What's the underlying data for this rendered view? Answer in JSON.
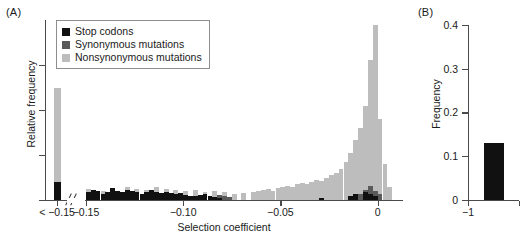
{
  "panels": {
    "a": {
      "label": "(A)"
    },
    "b": {
      "label": "(B)"
    }
  },
  "legend": {
    "items": [
      {
        "label": "Stop codons",
        "color": "#111111"
      },
      {
        "label": "Synonymous mutations",
        "color": "#5a5a5a"
      },
      {
        "label": "Nonsynonymous mutations",
        "color": "#bdbdbd"
      }
    ]
  },
  "chart_data": [
    {
      "type": "bar",
      "panel": "(A)",
      "title": "",
      "xlabel": "Selection coefficient",
      "ylabel": "Relative frequency",
      "xlim": [
        -0.163,
        0.012
      ],
      "ylim": [
        0,
        1.0
      ],
      "grid": false,
      "legend_position": "top-left",
      "axis_break": true,
      "axis_break_note": "break between the '< -0.15' overflow bin and the continuous axis starting at -0.15",
      "xticks": [
        {
          "value": -0.1595,
          "label": "< −0.15"
        },
        {
          "value": -0.15,
          "label": "−0.15"
        },
        {
          "value": -0.1,
          "label": "−0.10"
        },
        {
          "value": -0.05,
          "label": "−0.05"
        },
        {
          "value": 0.0,
          "label": "0"
        }
      ],
      "yticks": [
        0,
        0.25,
        0.5,
        0.75
      ],
      "ytick_labels": [
        "",
        "",
        "",
        ""
      ],
      "bin_width": 0.0025,
      "series": [
        {
          "name": "Stop codons",
          "color": "#111111",
          "overflow_bin": {
            "x": -0.1595,
            "value": 0.1
          },
          "x": [
            -0.1488,
            -0.1462,
            -0.1438,
            -0.1412,
            -0.1388,
            -0.1362,
            -0.1338,
            -0.1312,
            -0.1288,
            -0.1262,
            -0.1238,
            -0.1212,
            -0.1188,
            -0.1162,
            -0.1138,
            -0.1112,
            -0.1088,
            -0.1062,
            -0.1038,
            -0.1012,
            -0.0988,
            -0.0962,
            -0.0938,
            -0.0912,
            -0.0888,
            -0.0862,
            -0.0838,
            -0.0812,
            -0.0288,
            -0.0138,
            -0.0112,
            -0.0062,
            -0.0038,
            -0.0012
          ],
          "values": [
            0.04,
            0.055,
            0.05,
            0.03,
            0.04,
            0.065,
            0.05,
            0.045,
            0.055,
            0.05,
            0.045,
            0.03,
            0.045,
            0.055,
            0.04,
            0.035,
            0.045,
            0.035,
            0.03,
            0.035,
            0.025,
            0.02,
            0.02,
            0.025,
            0.03,
            0.02,
            0.015,
            0.01,
            0.01,
            0.02,
            0.03,
            0.04,
            0.03,
            0.02
          ]
        },
        {
          "name": "Synonymous mutations",
          "color": "#5a5a5a",
          "x": [
            -0.0812,
            -0.0788,
            -0.0762,
            -0.0138,
            -0.0088,
            -0.0062,
            -0.0038,
            -0.0012,
            0.0012
          ],
          "values": [
            0.025,
            0.02,
            0.015,
            0.02,
            0.03,
            0.055,
            0.075,
            0.05,
            0.03
          ]
        },
        {
          "name": "Nonsynonymous mutations",
          "color": "#bdbdbd",
          "overflow_bin": {
            "x": -0.1595,
            "value": 0.62
          },
          "x": [
            -0.1488,
            -0.1412,
            -0.1362,
            -0.1288,
            -0.1238,
            -0.1188,
            -0.1138,
            -0.1088,
            -0.1038,
            -0.0988,
            -0.0938,
            -0.0888,
            -0.0838,
            -0.0788,
            -0.0738,
            -0.0688,
            -0.0638,
            -0.0612,
            -0.0588,
            -0.0562,
            -0.0538,
            -0.0512,
            -0.0488,
            -0.0462,
            -0.0438,
            -0.0412,
            -0.0388,
            -0.0362,
            -0.0338,
            -0.0312,
            -0.0288,
            -0.0262,
            -0.0238,
            -0.0212,
            -0.0188,
            -0.0162,
            -0.0138,
            -0.0112,
            -0.0088,
            -0.0062,
            -0.0038,
            -0.0012,
            0.0012,
            0.0038,
            0.0062
          ],
          "values": [
            0.06,
            0.05,
            0.065,
            0.07,
            0.06,
            0.055,
            0.07,
            0.06,
            0.055,
            0.05,
            0.055,
            0.045,
            0.05,
            0.04,
            0.03,
            0.035,
            0.045,
            0.05,
            0.055,
            0.06,
            0.05,
            0.065,
            0.07,
            0.075,
            0.07,
            0.085,
            0.09,
            0.085,
            0.1,
            0.11,
            0.105,
            0.12,
            0.135,
            0.15,
            0.17,
            0.21,
            0.26,
            0.33,
            0.4,
            0.52,
            0.78,
            0.97,
            0.45,
            0.2,
            0.07
          ]
        }
      ]
    },
    {
      "type": "bar",
      "panel": "(B)",
      "title": "",
      "xlabel": "",
      "ylabel": "Frequency",
      "ylim": [
        0,
        0.4
      ],
      "yticks": [
        0,
        0.1,
        0.2,
        0.3,
        0.4
      ],
      "ytick_labels": [
        "0",
        "0.1",
        "0.2",
        "0.3",
        "0.4"
      ],
      "xticks": [
        {
          "value": -1,
          "label": "−1"
        },
        {
          "value": -0.5,
          "label": ""
        }
      ],
      "grid": false,
      "cropped_right_edge": true,
      "series": [
        {
          "name": "Stop codons",
          "color": "#111111",
          "x": [
            -0.85
          ],
          "values": [
            0.13
          ]
        }
      ]
    }
  ]
}
